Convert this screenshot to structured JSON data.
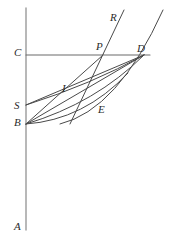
{
  "figure": {
    "background_color": "#ffffff",
    "stroke_color": "#4a4a4a",
    "axis_color": "#8a8a8a",
    "label_color": "#2b2b2b",
    "width": 180,
    "height": 251,
    "labels": [
      {
        "id": "R",
        "text": "R",
        "x": 110,
        "y": 12
      },
      {
        "id": "C",
        "text": "C",
        "x": 14,
        "y": 47
      },
      {
        "id": "P",
        "text": "P",
        "x": 96,
        "y": 41
      },
      {
        "id": "D",
        "text": "D",
        "x": 137,
        "y": 43
      },
      {
        "id": "S",
        "text": "S",
        "x": 14,
        "y": 100
      },
      {
        "id": "I",
        "text": "I",
        "x": 62,
        "y": 83
      },
      {
        "id": "B",
        "text": "B",
        "x": 14,
        "y": 117
      },
      {
        "id": "E",
        "text": "E",
        "x": 98,
        "y": 104
      },
      {
        "id": "A",
        "text": "A",
        "x": 14,
        "y": 221
      }
    ],
    "points": [
      {
        "id": "C",
        "x": 26,
        "y": 55
      },
      {
        "id": "S",
        "x": 26,
        "y": 105
      },
      {
        "id": "B",
        "x": 26,
        "y": 124
      },
      {
        "id": "P",
        "x": 103,
        "y": 55
      },
      {
        "id": "D",
        "x": 144,
        "y": 55
      },
      {
        "id": "A",
        "x": 26,
        "y": 230
      }
    ],
    "strokes": [
      {
        "id": "vertical-axis",
        "kind": "line",
        "d": "M 26 8 L 26 230",
        "color": "#9a9a9a",
        "width": 1.4
      },
      {
        "id": "horizontal-line-CD",
        "kind": "line",
        "d": "M 26 55 L 150 55",
        "color": "#6b6b6b",
        "width": 1.1
      },
      {
        "id": "line-R",
        "kind": "line",
        "d": "M 70 124 L 124 10",
        "color": "#4a4a4a",
        "width": 1.0
      },
      {
        "id": "chord-S-D",
        "kind": "line",
        "d": "M 26 105 L 144 55",
        "color": "#4a4a4a",
        "width": 1.0
      },
      {
        "id": "chord-B-D",
        "kind": "line",
        "d": "M 26 124 L 144 55",
        "color": "#4a4a4a",
        "width": 1.0
      },
      {
        "id": "chord-B-P",
        "kind": "line",
        "d": "M 26 124 L 103 55",
        "color": "#4a4a4a",
        "width": 1.0
      },
      {
        "id": "curve-S-D-upper",
        "kind": "curve",
        "d": "M 26 105 Q 92 84 144 55",
        "color": "#4a4a4a",
        "width": 1.0
      },
      {
        "id": "curve-B-D-mid",
        "kind": "curve",
        "d": "M 26 124 Q 96 103 144 55",
        "color": "#4a4a4a",
        "width": 1.0
      },
      {
        "id": "curve-B-E-D",
        "kind": "curve",
        "d": "M 26 124 Q 84 120 128 73",
        "color": "#4a4a4a",
        "width": 1.0
      },
      {
        "id": "curve-through-D-rising",
        "kind": "curve",
        "d": "M 60 124 Q 118 110 163 10",
        "color": "#4a4a4a",
        "width": 1.0
      }
    ]
  }
}
